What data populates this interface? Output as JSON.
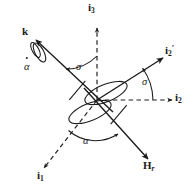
{
  "figure": {
    "kind": "vector-diagram",
    "stroke_color": "#1a1a1a",
    "background_color": "#ffffff"
  },
  "labels": {
    "i3": {
      "base": "i",
      "sub": "3",
      "name": "axis-i3"
    },
    "i1": {
      "base": "i",
      "sub": "1",
      "name": "axis-i1"
    },
    "i2": {
      "base": "i",
      "sub": "2",
      "name": "axis-i2"
    },
    "i2prime": {
      "base": "i",
      "sub": "2",
      "prime": "′",
      "name": "axis-i2-prime"
    },
    "k": {
      "base": "k",
      "name": "axis-k"
    },
    "Hr": {
      "base": "H",
      "sub": "r",
      "name": "angular-momentum-Hr"
    },
    "alpha_dot": {
      "symbol": "α",
      "name": "alpha-dot-rate"
    },
    "alpha": {
      "symbol": "α",
      "name": "alpha-angle"
    },
    "sigma_top": {
      "symbol": "σ",
      "name": "sigma-angle-upper"
    },
    "sigma_right": {
      "symbol": "σ",
      "name": "sigma-angle-right"
    }
  }
}
